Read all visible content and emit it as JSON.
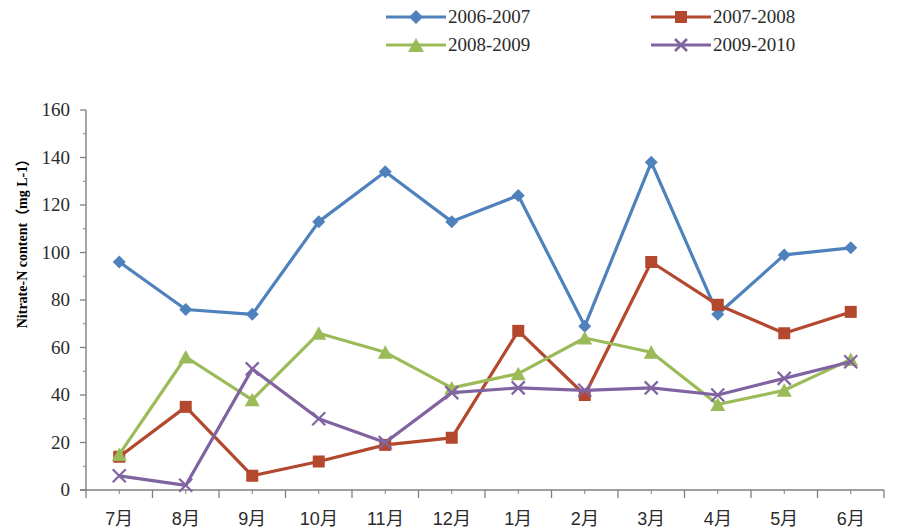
{
  "chart_data": {
    "type": "line",
    "title": "",
    "xlabel": "",
    "ylabel": "Nitrate-N content（mg L-1）",
    "ylabel_plain": "Nitrate-N content (mg L-1)",
    "ylim": [
      0,
      160
    ],
    "ytick_step": 20,
    "yticks": [
      0,
      20,
      40,
      60,
      80,
      100,
      120,
      140,
      160
    ],
    "categories": [
      "7月",
      "8月",
      "9月",
      "10月",
      "11月",
      "12月",
      "1月",
      "2月",
      "3月",
      "4月",
      "5月",
      "6月"
    ],
    "grid": false,
    "legend_position": "top",
    "series": [
      {
        "name": "2006-2007",
        "color": "#4f81bd",
        "marker": "diamond",
        "values": [
          96,
          76,
          74,
          113,
          134,
          113,
          124,
          69,
          138,
          74,
          99,
          102
        ]
      },
      {
        "name": "2007-2008",
        "color": "#b4482e",
        "marker": "square",
        "values": [
          14,
          35,
          6,
          12,
          19,
          22,
          67,
          40,
          96,
          78,
          66,
          75
        ]
      },
      {
        "name": "2008-2009",
        "color": "#9bbb59",
        "marker": "triangle",
        "values": [
          15,
          56,
          38,
          66,
          58,
          43,
          49,
          64,
          58,
          36,
          42,
          55
        ]
      },
      {
        "name": "2009-2010",
        "color": "#8064a2",
        "marker": "x",
        "values": [
          6,
          2,
          51,
          30,
          20,
          41,
          43,
          42,
          43,
          40,
          47,
          54
        ]
      }
    ]
  },
  "legend": {
    "entries": [
      {
        "label": "2006-2007"
      },
      {
        "label": "2007-2008"
      },
      {
        "label": "2008-2009"
      },
      {
        "label": "2009-2010"
      }
    ]
  },
  "axis": {
    "y_title": "Nitrate-N content（mg L-1）",
    "y_labels": [
      "160",
      "140",
      "120",
      "100",
      "80",
      "60",
      "40",
      "20",
      "0"
    ],
    "x_labels": [
      "7月",
      "8月",
      "9月",
      "10月",
      "11月",
      "12月",
      "1月",
      "2月",
      "3月",
      "4月",
      "5月",
      "6月"
    ]
  }
}
